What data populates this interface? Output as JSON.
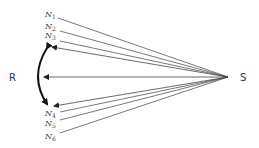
{
  "diagram": {
    "source_label": "S",
    "receiver_label": "R",
    "nodes": [
      {
        "letter": "N",
        "sub": "1"
      },
      {
        "letter": "N",
        "sub": "2"
      },
      {
        "letter": "N",
        "sub": "3"
      },
      {
        "letter": "N",
        "sub": "4"
      },
      {
        "letter": "N",
        "sub": "5"
      },
      {
        "letter": "N",
        "sub": "6"
      }
    ],
    "colors": {
      "line": "#555555",
      "arc": "#111111",
      "text": "#444444"
    }
  }
}
